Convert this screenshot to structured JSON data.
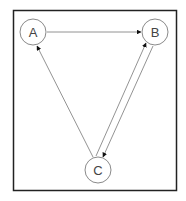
{
  "diagram": {
    "type": "directed-graph",
    "nodes": [
      {
        "id": "A",
        "label": "A"
      },
      {
        "id": "B",
        "label": "B"
      },
      {
        "id": "C",
        "label": "C"
      }
    ],
    "edges": [
      {
        "from": "A",
        "to": "B"
      },
      {
        "from": "C",
        "to": "A"
      },
      {
        "from": "C",
        "to": "B"
      },
      {
        "from": "B",
        "to": "C"
      }
    ],
    "colors": {
      "frame": "#222222",
      "node_stroke": "#8a8a8a",
      "edge": "#777777",
      "arrowhead": "#111111"
    }
  }
}
